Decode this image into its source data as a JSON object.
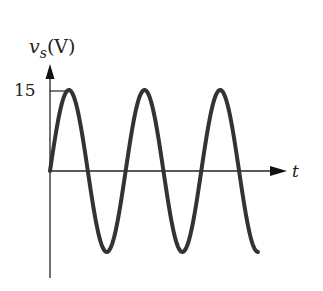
{
  "diagram": {
    "y_axis_label": "v",
    "y_axis_subscript": "s",
    "y_axis_unit": "(V)",
    "x_axis_label": "t",
    "peak_tick_label": "15"
  },
  "waveform": {
    "type": "sine",
    "amplitude": 15,
    "cycles": 2.75,
    "color": "#333333"
  }
}
